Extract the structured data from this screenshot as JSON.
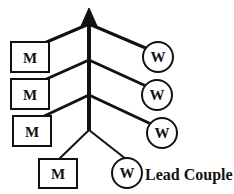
{
  "diagram": {
    "type": "dance-formation-tree",
    "background_color": "#ffffff",
    "line_color": "#111111",
    "caption": "Lead Couple",
    "men": [
      {
        "label": "M",
        "name": "man-1"
      },
      {
        "label": "M",
        "name": "man-2"
      },
      {
        "label": "M",
        "name": "man-3"
      },
      {
        "label": "M",
        "name": "man-4"
      }
    ],
    "women": [
      {
        "label": "W",
        "name": "woman-1"
      },
      {
        "label": "W",
        "name": "woman-2"
      },
      {
        "label": "W",
        "name": "woman-3"
      },
      {
        "label": "W",
        "name": "woman-4"
      }
    ],
    "arrow": {
      "name": "direction-arrow",
      "description": "upward arrow"
    }
  }
}
